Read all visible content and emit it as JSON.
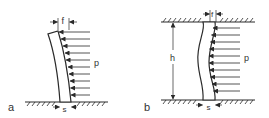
{
  "figure": {
    "colors": {
      "stroke": "#2a2a2a",
      "background": "#ffffff"
    },
    "panels": [
      {
        "id": "a",
        "label": "a",
        "description": "cantilever wall fixed at base, deflected by uniform horizontal pressure",
        "load_label": "p",
        "deflection_label": "f",
        "thickness_label": "s",
        "arrow_count": 10
      },
      {
        "id": "b",
        "label": "b",
        "description": "wall fixed at top and bottom, deflected by uniform horizontal pressure",
        "load_label": "p",
        "deflection_label": "f",
        "thickness_label": "s",
        "height_label": "h",
        "arrow_count": 10
      }
    ]
  }
}
